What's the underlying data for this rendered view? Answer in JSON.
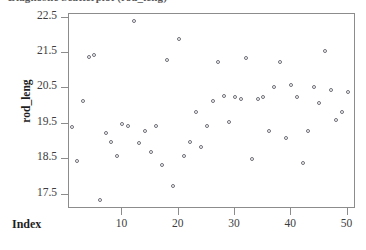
{
  "chart_data": {
    "type": "scatter",
    "title": "Diagnostic Scatterplot (rod_leng)",
    "xlabel": "Index",
    "ylabel": "rod_leng",
    "grid": false,
    "legend": null,
    "marker": "open-circle",
    "marker_color": "#6e6e78",
    "frame_color": "#8c8c8c",
    "xlim": [
      0.5,
      51.5
    ],
    "ylim": [
      17.1,
      22.6
    ],
    "xticks": [
      10,
      20,
      30,
      40,
      50
    ],
    "yticks": [
      22.5,
      21.5,
      20.5,
      19.5,
      18.5,
      17.5
    ],
    "xtick_labels": [
      "10",
      "20",
      "30",
      "40",
      "50"
    ],
    "ytick_labels": [
      "22.5",
      "21.5",
      "20.5",
      "19.5",
      "18.5",
      "17.5"
    ],
    "x": [
      1,
      2,
      3,
      4,
      5,
      6,
      7,
      8,
      9,
      10,
      11,
      12,
      13,
      14,
      15,
      16,
      17,
      18,
      19,
      20,
      21,
      22,
      23,
      24,
      25,
      26,
      27,
      28,
      29,
      30,
      31,
      32,
      33,
      34,
      35,
      36,
      37,
      38,
      39,
      40,
      41,
      42,
      43,
      44,
      45,
      46,
      47,
      48,
      49,
      50
    ],
    "y": [
      19.4,
      18.45,
      20.15,
      21.4,
      21.45,
      17.35,
      19.25,
      19.0,
      18.6,
      19.5,
      19.45,
      22.4,
      18.95,
      19.3,
      18.7,
      19.45,
      18.35,
      21.3,
      17.75,
      21.9,
      18.6,
      19.0,
      19.85,
      18.85,
      19.45,
      20.15,
      21.25,
      20.3,
      19.55,
      20.25,
      20.2,
      21.35,
      18.5,
      20.2,
      20.25,
      19.3,
      20.55,
      21.25,
      19.1,
      20.6,
      20.25,
      18.4,
      19.3,
      20.55,
      20.1,
      21.55,
      20.45,
      19.6,
      19.85,
      20.4
    ],
    "points": [
      {
        "index": 1,
        "value": 19.4
      },
      {
        "index": 2,
        "value": 18.45
      },
      {
        "index": 3,
        "value": 20.15
      },
      {
        "index": 4,
        "value": 21.4
      },
      {
        "index": 5,
        "value": 21.45
      },
      {
        "index": 6,
        "value": 17.35
      },
      {
        "index": 7,
        "value": 19.25
      },
      {
        "index": 8,
        "value": 19.0
      },
      {
        "index": 9,
        "value": 18.6
      },
      {
        "index": 10,
        "value": 19.5
      },
      {
        "index": 11,
        "value": 19.45
      },
      {
        "index": 12,
        "value": 22.4
      },
      {
        "index": 13,
        "value": 18.95
      },
      {
        "index": 14,
        "value": 19.3
      },
      {
        "index": 15,
        "value": 18.7
      },
      {
        "index": 16,
        "value": 19.45
      },
      {
        "index": 17,
        "value": 18.35
      },
      {
        "index": 18,
        "value": 21.3
      },
      {
        "index": 19,
        "value": 17.75
      },
      {
        "index": 20,
        "value": 21.9
      },
      {
        "index": 21,
        "value": 18.6
      },
      {
        "index": 22,
        "value": 19.0
      },
      {
        "index": 23,
        "value": 19.85
      },
      {
        "index": 24,
        "value": 18.85
      },
      {
        "index": 25,
        "value": 19.45
      },
      {
        "index": 26,
        "value": 20.15
      },
      {
        "index": 27,
        "value": 21.25
      },
      {
        "index": 28,
        "value": 20.3
      },
      {
        "index": 29,
        "value": 19.55
      },
      {
        "index": 30,
        "value": 20.25
      },
      {
        "index": 31,
        "value": 20.2
      },
      {
        "index": 32,
        "value": 21.35
      },
      {
        "index": 33,
        "value": 18.5
      },
      {
        "index": 34,
        "value": 20.2
      },
      {
        "index": 35,
        "value": 20.25
      },
      {
        "index": 36,
        "value": 19.3
      },
      {
        "index": 37,
        "value": 20.55
      },
      {
        "index": 38,
        "value": 21.25
      },
      {
        "index": 39,
        "value": 19.1
      },
      {
        "index": 40,
        "value": 20.6
      },
      {
        "index": 41,
        "value": 20.25
      },
      {
        "index": 42,
        "value": 18.4
      },
      {
        "index": 43,
        "value": 19.3
      },
      {
        "index": 44,
        "value": 20.55
      },
      {
        "index": 45,
        "value": 20.1
      },
      {
        "index": 46,
        "value": 21.55
      },
      {
        "index": 47,
        "value": 20.45
      },
      {
        "index": 48,
        "value": 19.6
      },
      {
        "index": 49,
        "value": 19.85
      },
      {
        "index": 50,
        "value": 20.4
      }
    ]
  }
}
